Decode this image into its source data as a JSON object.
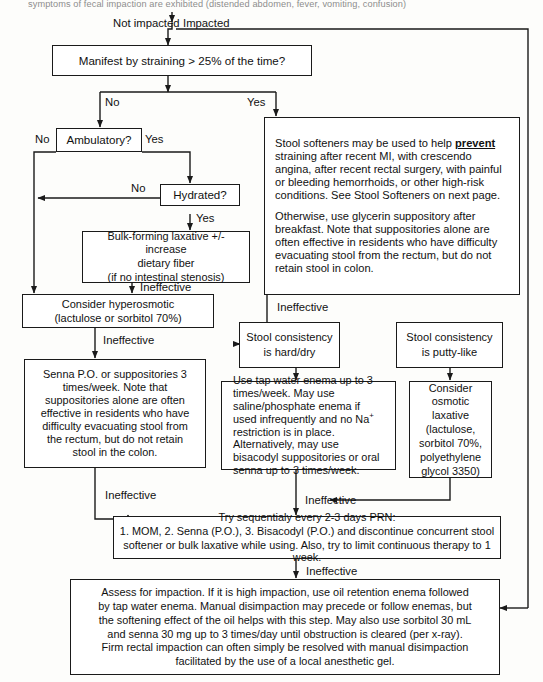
{
  "page": {
    "header_text": "symptoms of fecal impaction are exhibited (distended abdomen, fever, vomiting, confusion)",
    "line_color": "#1a1a1a",
    "background": "#fdfdfb"
  },
  "edge_labels": {
    "not_impacted": "Not impacted",
    "impacted": "Impacted",
    "no_1": "No",
    "yes_1": "Yes",
    "amb_no": "No",
    "amb_yes": "Yes",
    "hyd_no": "No",
    "hyd_yes": "Yes",
    "ineffective_1": "Ineffective",
    "ineffective_2": "Ineffective",
    "ineffective_3": "Ineffective",
    "ineffective_4": "Ineffective",
    "ineffective_5": "Ineffective",
    "ineffective_6": "Ineffective"
  },
  "nodes": {
    "manifest": "Manifest by straining > 25% of the time?",
    "ambulatory": "Ambulatory?",
    "hydrated": "Hydrated?",
    "bulk_forming": {
      "line1": "Bulk-forming laxative +/- increase",
      "line2": "dietary fiber",
      "line3": "(if no intestinal stenosis)"
    },
    "hyperosmotic": {
      "line1": "Consider hyperosmotic",
      "line2": "(lactulose or sorbitol 70%)"
    },
    "softeners": {
      "para1_a": "Stool softeners may be used to help ",
      "para1_bold": "prevent",
      "para1_b": " straining after recent MI, with crescendo angina, after recent rectal surgery, with painful or bleeding hemorrhoids, or other high-risk conditions.  See Stool Softeners on next page.",
      "para2": "Otherwise, use glycerin suppository after breakfast.  Note that suppositories alone are often effective in residents who have difficulty evacuating stool from the rectum, but do not retain stool in colon."
    },
    "senna_po": "Senna P.O. or suppositories 3 times/week.  Note that suppositories alone are often effective in residents who have difficulty evacuating stool from the rectum, but do not retain stool in the colon.",
    "consistency_hard": {
      "line1": "Stool consistency",
      "line2": "is hard/dry"
    },
    "consistency_putty": {
      "line1": "Stool consistency",
      "line2": "is putty-like"
    },
    "tap_water": {
      "a": "Use tap water enema up to 3 times/week.  May use saline/phosphate enema if used infrequently and no Na",
      "sup": "+",
      "b": " restriction is in place. Alternatively, may use bisacodyl suppositories or oral senna up to 3 times/week."
    },
    "osmotic": {
      "line1": "Consider",
      "line2": "osmotic",
      "line3": "laxative",
      "line4": "(lactulose,",
      "line5": "sorbitol 70%,",
      "line6": "polyethylene",
      "line7": "glycol 3350)"
    },
    "sequential": {
      "line1": "Try sequentialy every 2-3 days PRN:",
      "line2": "1. MOM,  2. Senna (P.O.),  3. Bisacodyl (P.O.) and discontinue concurrent stool",
      "line3": "softener or bulk laxative while using.  Also, try to limit continuous therapy to 1 week."
    },
    "impaction": {
      "line1": "Assess for impaction.  If it is high impaction, use oil retention enema followed",
      "line2": "by tap water enema.  Manual disimpaction may precede or follow enemas, but",
      "line3": "the softening effect of the oil helps with this step.  May also use sorbitol 30 mL",
      "line4": "and senna 30 mg up to 3 times/day until obstruction is cleared (per x-ray).",
      "line5": "Firm rectal impaction can often simply be resolved with manual disimpaction",
      "line6": "facilitated by the use of a local anesthetic gel."
    }
  }
}
